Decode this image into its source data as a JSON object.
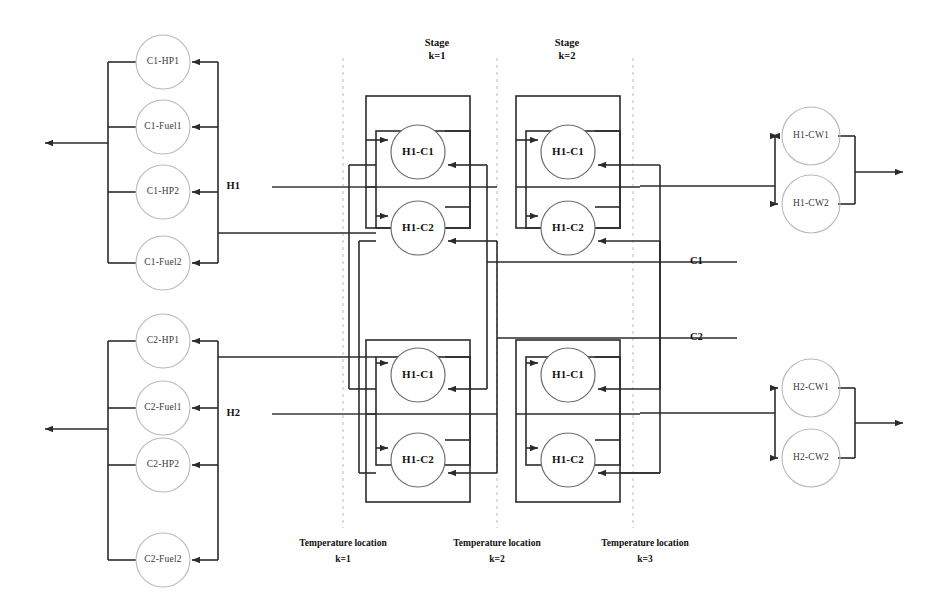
{
  "figure": {
    "colors": {
      "wire": "#2b2b2b",
      "utility_circle": "#b9b9b9",
      "exchanger_circle": "#6f6f6f",
      "dashed_guide": "#c2c2c2",
      "background": "#ffffff"
    }
  },
  "stage_headers": [
    {
      "title": "Stage",
      "index": "k=1",
      "x": 437,
      "y": 47
    },
    {
      "title": "Stage",
      "index": "k=2",
      "x": 567,
      "y": 47
    }
  ],
  "temperature_locations": [
    {
      "title": "Temperature location",
      "index": "k=1",
      "x": 343,
      "y": 545
    },
    {
      "title": "Temperature location",
      "index": "k=2",
      "x": 497,
      "y": 545
    },
    {
      "title": "Temperature location",
      "index": "k=3",
      "x": 645,
      "y": 545
    }
  ],
  "dashed_guides_x": [
    343,
    497,
    633
  ],
  "hot_stream_inlets": [
    {
      "label": "H1",
      "x": 252,
      "y": 187
    },
    {
      "label": "H2",
      "x": 252,
      "y": 414
    }
  ],
  "cold_stream_inlets": [
    {
      "label": "C1",
      "x": 697,
      "y": 262
    },
    {
      "label": "C2",
      "x": 697,
      "y": 338
    }
  ],
  "left_utility_banks": [
    {
      "name": "C1-utilities",
      "bus_out_x": 108,
      "bus_in_x": 218,
      "out_arrow_y": 143,
      "units": [
        {
          "label": "C1-HP1",
          "cx": 163,
          "cy": 62
        },
        {
          "label": "C1-Fuel1",
          "cx": 163,
          "cy": 127
        },
        {
          "label": "C1-HP2",
          "cx": 163,
          "cy": 192
        },
        {
          "label": "C1-Fuel2",
          "cx": 163,
          "cy": 263
        }
      ]
    },
    {
      "name": "C2-utilities",
      "bus_out_x": 108,
      "bus_in_x": 218,
      "out_arrow_y": 414,
      "units": [
        {
          "label": "C2-HP1",
          "cx": 163,
          "cy": 341
        },
        {
          "label": "C2-Fuel1",
          "cx": 163,
          "cy": 408
        },
        {
          "label": "C2-HP2",
          "cx": 163,
          "cy": 465
        },
        {
          "label": "C2-Fuel2",
          "cx": 163,
          "cy": 560
        }
      ]
    }
  ],
  "right_cooler_banks": [
    {
      "name": "H1-coolers",
      "feed_y": 186,
      "split_x": 775,
      "merge_x": 855,
      "out_arrow_x": 900,
      "units": [
        {
          "label": "H1-CW1",
          "cx": 811,
          "cy": 136
        },
        {
          "label": "H1-CW2",
          "cx": 811,
          "cy": 204
        }
      ]
    },
    {
      "name": "H2-coolers",
      "feed_y": 413,
      "split_x": 775,
      "merge_x": 855,
      "out_arrow_x": 900,
      "units": [
        {
          "label": "H2-CW1",
          "cx": 811,
          "cy": 388
        },
        {
          "label": "H2-CW2",
          "cx": 811,
          "cy": 458
        }
      ]
    }
  ],
  "exchanger_grid": {
    "circle_radius": 27,
    "stage_block_x": [
      366,
      516
    ],
    "stage_block_width": 104,
    "rows": [
      {
        "label": "H1-C1",
        "cy": 152
      },
      {
        "label": "H1-C2",
        "cy": 228
      },
      {
        "label": "H1-C1",
        "cy": 375
      },
      {
        "label": "H1-C2",
        "cy": 460
      }
    ],
    "exchangers": [
      {
        "label": "H1-C1",
        "cx": 418,
        "cy": 152,
        "stage": 1,
        "hot": "H1",
        "cold": "C1"
      },
      {
        "label": "H1-C2",
        "cx": 418,
        "cy": 228,
        "stage": 1,
        "hot": "H1",
        "cold": "C2"
      },
      {
        "label": "H1-C1",
        "cx": 568,
        "cy": 152,
        "stage": 2,
        "hot": "H1",
        "cold": "C1"
      },
      {
        "label": "H1-C2",
        "cx": 568,
        "cy": 228,
        "stage": 2,
        "hot": "H1",
        "cold": "C2"
      },
      {
        "label": "H1-C1",
        "cx": 418,
        "cy": 375,
        "stage": 1,
        "hot": "H2",
        "cold": "C1"
      },
      {
        "label": "H1-C2",
        "cx": 418,
        "cy": 460,
        "stage": 1,
        "hot": "H2",
        "cold": "C2"
      },
      {
        "label": "H1-C1",
        "cx": 568,
        "cy": 375,
        "stage": 2,
        "hot": "H2",
        "cold": "C1"
      },
      {
        "label": "H1-C2",
        "cx": 568,
        "cy": 460,
        "stage": 2,
        "hot": "H2",
        "cold": "C2"
      }
    ]
  }
}
